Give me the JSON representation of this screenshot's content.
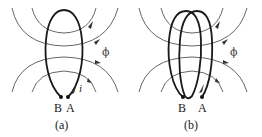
{
  "figure": {
    "panels": [
      {
        "id": "a",
        "caption": "(a)",
        "flux_label": "ϕ",
        "current_label": "i",
        "terminal_left": "B",
        "terminal_right": "A",
        "coil_turns": 1
      },
      {
        "id": "b",
        "caption": "(b)",
        "flux_label": "ϕ",
        "terminal_left": "B",
        "terminal_right": "A",
        "coil_turns": 2
      }
    ]
  }
}
